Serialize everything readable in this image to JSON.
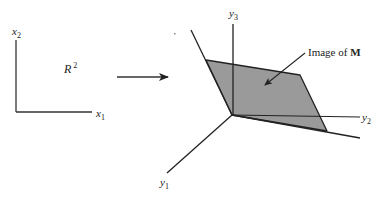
{
  "colors": {
    "stroke": "#222222",
    "plane_fill": "#9a9a9a",
    "background": "#ffffff"
  },
  "domain_space": {
    "name": "R",
    "superscript": "2",
    "axes": {
      "horizontal": {
        "base": "x",
        "sub": "1"
      },
      "vertical": {
        "base": "x",
        "sub": "2"
      }
    }
  },
  "mapping_arrow": {
    "icon": "right-arrow-icon"
  },
  "codomain_space": {
    "axes": {
      "y1": {
        "base": "y",
        "sub": "1"
      },
      "y2": {
        "base": "y",
        "sub": "2"
      },
      "y3": {
        "base": "y",
        "sub": "3"
      }
    },
    "plane_label": {
      "prefix": "Image of ",
      "symbol": "M"
    }
  }
}
